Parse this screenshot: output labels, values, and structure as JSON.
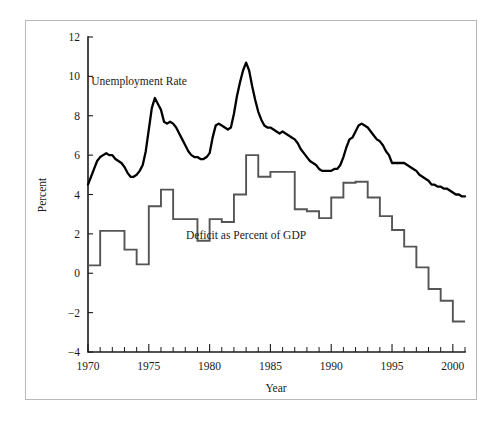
{
  "figure": {
    "frame_color": "#b8b8b8",
    "background": "#ffffff"
  },
  "chart_data": {
    "type": "line",
    "title": "",
    "xlabel": "Year",
    "ylabel": "Percent",
    "xlim": [
      1970,
      2001
    ],
    "ylim": [
      -4,
      12
    ],
    "grid": false,
    "legend_position": "in-plot-annotations",
    "y_ticks": [
      -4,
      -2,
      0,
      2,
      4,
      6,
      8,
      10,
      12
    ],
    "y_tick_labels": [
      "−4",
      "−2",
      "0",
      "2",
      "4",
      "6",
      "8",
      "10",
      "12"
    ],
    "x_ticks": [
      1970,
      1975,
      1980,
      1985,
      1990,
      1995,
      2000
    ],
    "x_tick_labels": [
      "1970",
      "1975",
      "1980",
      "1985",
      "1990",
      "1995",
      "2000"
    ],
    "x_minor_tick_step": 1,
    "annotations": [
      {
        "text": "Unemployment Rate",
        "x": 1974.2,
        "y": 9.55
      },
      {
        "text": "Deficit as Percent of GDP",
        "x": 1983.0,
        "y": 1.75
      }
    ],
    "series": [
      {
        "name": "Unemployment Rate",
        "style": "smooth",
        "color": "#000000",
        "width": 2.3,
        "x": [
          1970.0,
          1970.25,
          1970.5,
          1970.75,
          1971.0,
          1971.25,
          1971.5,
          1971.75,
          1972.0,
          1972.25,
          1972.5,
          1972.75,
          1973.0,
          1973.25,
          1973.5,
          1973.75,
          1974.0,
          1974.25,
          1974.5,
          1974.75,
          1975.0,
          1975.25,
          1975.5,
          1975.75,
          1976.0,
          1976.25,
          1976.5,
          1976.75,
          1977.0,
          1977.25,
          1977.5,
          1977.75,
          1978.0,
          1978.25,
          1978.5,
          1978.75,
          1979.0,
          1979.25,
          1979.5,
          1979.75,
          1980.0,
          1980.25,
          1980.5,
          1980.75,
          1981.0,
          1981.25,
          1981.5,
          1981.75,
          1982.0,
          1982.25,
          1982.5,
          1982.75,
          1983.0,
          1983.25,
          1983.5,
          1983.75,
          1984.0,
          1984.25,
          1984.5,
          1984.75,
          1985.0,
          1985.25,
          1985.5,
          1985.75,
          1986.0,
          1986.25,
          1986.5,
          1986.75,
          1987.0,
          1987.25,
          1987.5,
          1987.75,
          1988.0,
          1988.25,
          1988.5,
          1988.75,
          1989.0,
          1989.25,
          1989.5,
          1989.75,
          1990.0,
          1990.25,
          1990.5,
          1990.75,
          1991.0,
          1991.25,
          1991.5,
          1991.75,
          1992.0,
          1992.25,
          1992.5,
          1992.75,
          1993.0,
          1993.25,
          1993.5,
          1993.75,
          1994.0,
          1994.25,
          1994.5,
          1994.75,
          1995.0,
          1995.25,
          1995.5,
          1995.75,
          1996.0,
          1996.25,
          1996.5,
          1996.75,
          1997.0,
          1997.25,
          1997.5,
          1997.75,
          1998.0,
          1998.25,
          1998.5,
          1998.75,
          1999.0,
          1999.25,
          1999.5,
          1999.75,
          2000.0,
          2000.25,
          2000.5,
          2000.75,
          2001.0
        ],
        "y": [
          4.5,
          4.9,
          5.3,
          5.7,
          5.9,
          6.0,
          6.1,
          6.0,
          6.0,
          5.8,
          5.7,
          5.6,
          5.4,
          5.1,
          4.9,
          4.9,
          5.0,
          5.2,
          5.5,
          6.2,
          7.3,
          8.4,
          8.9,
          8.6,
          8.3,
          7.7,
          7.6,
          7.7,
          7.6,
          7.4,
          7.1,
          6.8,
          6.5,
          6.2,
          6.0,
          5.9,
          5.9,
          5.8,
          5.8,
          5.9,
          6.1,
          6.9,
          7.5,
          7.6,
          7.5,
          7.4,
          7.3,
          7.4,
          8.1,
          9.0,
          9.7,
          10.3,
          10.7,
          10.3,
          9.5,
          8.8,
          8.2,
          7.8,
          7.5,
          7.4,
          7.4,
          7.3,
          7.2,
          7.1,
          7.2,
          7.1,
          7.0,
          6.9,
          6.8,
          6.6,
          6.3,
          6.1,
          5.9,
          5.7,
          5.6,
          5.5,
          5.3,
          5.2,
          5.2,
          5.2,
          5.2,
          5.3,
          5.3,
          5.5,
          5.9,
          6.4,
          6.8,
          6.9,
          7.2,
          7.5,
          7.6,
          7.5,
          7.4,
          7.2,
          7.0,
          6.8,
          6.7,
          6.5,
          6.2,
          6.0,
          5.6,
          5.6,
          5.6,
          5.6,
          5.6,
          5.5,
          5.4,
          5.3,
          5.2,
          5.0,
          4.9,
          4.8,
          4.7,
          4.5,
          4.5,
          4.4,
          4.4,
          4.3,
          4.3,
          4.2,
          4.1,
          4.0,
          4.0,
          3.9,
          3.9
        ]
      },
      {
        "name": "Deficit as Percent of GDP",
        "style": "step",
        "color": "#555555",
        "width": 1.9,
        "x": [
          1970,
          1971,
          1972,
          1973,
          1974,
          1975,
          1976,
          1977,
          1978,
          1979,
          1980,
          1981,
          1982,
          1983,
          1984,
          1985,
          1986,
          1987,
          1988,
          1989,
          1990,
          1991,
          1992,
          1993,
          1994,
          1995,
          1996,
          1997,
          1998,
          1999,
          2000,
          2001
        ],
        "y": [
          0.4,
          2.15,
          2.15,
          1.2,
          0.45,
          3.4,
          4.25,
          2.75,
          2.75,
          1.65,
          2.75,
          2.6,
          4.0,
          6.0,
          4.9,
          5.15,
          5.15,
          3.25,
          3.15,
          2.8,
          3.85,
          4.6,
          4.65,
          3.85,
          2.9,
          2.2,
          1.35,
          0.3,
          -0.8,
          -1.4,
          -2.45,
          -2.45
        ]
      }
    ]
  },
  "labels": {
    "y_axis_title": "Percent",
    "x_axis_title": "Year",
    "series_unemployment": "Unemployment Rate",
    "series_deficit": "Deficit as Percent of GDP"
  }
}
